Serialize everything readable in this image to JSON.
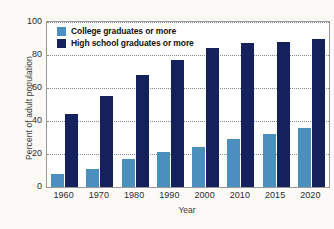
{
  "chart_data": {
    "type": "bar",
    "title": "",
    "subtitle": "",
    "xlabel": "Year",
    "ylabel": "Percent of adult population",
    "categories": [
      "1960",
      "1970",
      "1980",
      "1990",
      "2000",
      "2010",
      "2015",
      "2020"
    ],
    "series": [
      {
        "name": "College graduates or more",
        "color": "#4a8fbd",
        "values": [
          8,
          11,
          17,
          21,
          24,
          29,
          32,
          36
        ]
      },
      {
        "name": "High school graduates or more",
        "color": "#15215c",
        "values": [
          44,
          55,
          68,
          77,
          84,
          87,
          88,
          90
        ]
      }
    ],
    "ylim": [
      0,
      100
    ],
    "yticks": [
      0,
      20,
      40,
      60,
      80,
      100
    ],
    "ytick_labels": [
      "0",
      "20",
      "40",
      "60",
      "80",
      "100"
    ],
    "grid": true,
    "grid_style": "dotted-horizontal",
    "legend_position": "top-left-inside",
    "plot_background": "#ffffff",
    "page_background": "#fbfaf7",
    "frame_color": "#9a9a9a"
  },
  "legend": {
    "items": [
      {
        "label": "College graduates or more",
        "color": "#4a8fbd"
      },
      {
        "label": "High school graduates or more",
        "color": "#15215c"
      }
    ]
  },
  "axes": {
    "y_title": "Percent of adult population",
    "x_title": "Year",
    "y_tick_100": "100",
    "y_tick_80": "80",
    "y_tick_60": "60",
    "y_tick_40": "40",
    "y_tick_20": "20",
    "y_tick_0": "0"
  }
}
